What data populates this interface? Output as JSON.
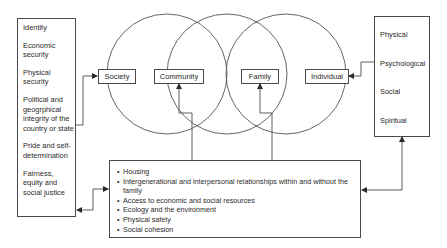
{
  "left_box": {
    "items": [
      "Identity",
      "Economic security",
      "Physical security",
      "Political and geogrphical integrity of the country or state",
      "Pride and self-determination",
      "Fairness, equity and social justice"
    ]
  },
  "circles": {
    "labels": {
      "society": "Society",
      "community": "Community",
      "family": "Family",
      "individual": "Individual"
    }
  },
  "right_box": {
    "items": [
      "Physical",
      "Psychological",
      "Social",
      "Spiritual"
    ]
  },
  "bottom_box": {
    "items": [
      "Housing",
      "Intergenerational and interpersonal relationships within and without the family",
      "Access to economic and social resources",
      "Ecology and the environment",
      "Physical safety",
      "Social cohesion"
    ]
  },
  "colors": {
    "line": "#4a4a4a",
    "text": "#2a2a2a",
    "background": "#ffffff"
  }
}
